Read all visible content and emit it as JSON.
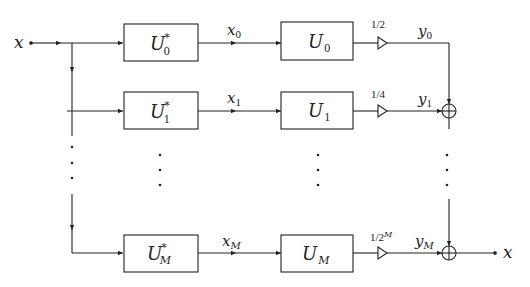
{
  "diagram": {
    "input_label": "x",
    "output_label": "x",
    "rows": [
      {
        "analysis": {
          "base": "U",
          "sub": "0",
          "sup": "*"
        },
        "signal": {
          "base": "x",
          "sub": "0"
        },
        "synthesis": {
          "base": "U",
          "sub": "0"
        },
        "gain": {
          "text": "1/2",
          "sup": ""
        },
        "output": {
          "base": "y",
          "sub": "0"
        }
      },
      {
        "analysis": {
          "base": "U",
          "sub": "1",
          "sup": "*"
        },
        "signal": {
          "base": "x",
          "sub": "1"
        },
        "synthesis": {
          "base": "U",
          "sub": "1"
        },
        "gain": {
          "text": "1/4",
          "sup": ""
        },
        "output": {
          "base": "y",
          "sub": "1"
        }
      },
      {
        "analysis": {
          "base": "U",
          "sub": "M",
          "sup": "*"
        },
        "signal": {
          "base": "x",
          "sub": "M"
        },
        "synthesis": {
          "base": "U",
          "sub": "M"
        },
        "gain": {
          "text": "1/2",
          "sup": "M"
        },
        "output": {
          "base": "y",
          "sub": "M"
        }
      }
    ],
    "ellipsis": "⋮",
    "summer_symbol": "sum-junction",
    "stroke_color": "#222222",
    "background": "#ffffff"
  }
}
